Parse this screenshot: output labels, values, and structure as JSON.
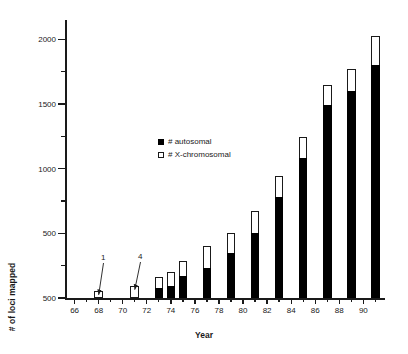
{
  "chart_data": {
    "type": "bar",
    "subtype": "stacked-bar",
    "title": "",
    "xlabel": "Year",
    "ylabel": "# of loci mapped",
    "grid": false,
    "legend_position": "inside-upper-left",
    "xlim": [
      65.2,
      91.8
    ],
    "ylim": [
      0,
      2150
    ],
    "y_major_ticks": [
      0,
      500,
      1000,
      1500,
      2000
    ],
    "y_major_tick_labels": [
      "500",
      "500",
      "1000",
      "1500",
      "2000"
    ],
    "y_minor_ticks": [
      250,
      750,
      1250,
      1750
    ],
    "x_major_ticks": [
      66,
      68,
      70,
      72,
      74,
      76,
      78,
      80,
      82,
      84,
      86,
      88,
      90
    ],
    "x_major_tick_labels": [
      "66",
      "68",
      "70",
      "72",
      "74",
      "76",
      "78",
      "80",
      "82",
      "84",
      "86",
      "88",
      "90"
    ],
    "x_minor_ticks": [
      67,
      69,
      71,
      73,
      75,
      77,
      79,
      81,
      83,
      85,
      87,
      89,
      91
    ],
    "categories": [
      68,
      71,
      73,
      74,
      75,
      77,
      79,
      81,
      83,
      85,
      87,
      89,
      91
    ],
    "series": [
      {
        "name": "# autosomal",
        "color": "#000000",
        "values": [
          0,
          0,
          80,
          95,
          170,
          230,
          345,
          505,
          785,
          1080,
          1490,
          1600,
          1800
        ]
      },
      {
        "name": "# X-chromosomal",
        "color": "#ffffff",
        "values": [
          55,
          95,
          85,
          110,
          120,
          175,
          155,
          165,
          155,
          165,
          160,
          175,
          230
        ]
      }
    ],
    "totals": [
      55,
      95,
      165,
      205,
      290,
      405,
      500,
      670,
      940,
      1245,
      1650,
      1775,
      2030
    ],
    "annotations": [
      {
        "text": "1",
        "points_to_year": 68,
        "text_x": 101,
        "text_y": 253
      },
      {
        "text": "4",
        "points_to_year": 71,
        "text_x": 138,
        "text_y": 252
      }
    ]
  },
  "axes": {
    "y_title": "# of loci mapped",
    "x_title": "Year"
  },
  "legend": {
    "items": [
      {
        "label": "# autosomal",
        "swatch": "filled-square"
      },
      {
        "label": "# X-chromosomal",
        "swatch": "hollow-square"
      }
    ]
  }
}
